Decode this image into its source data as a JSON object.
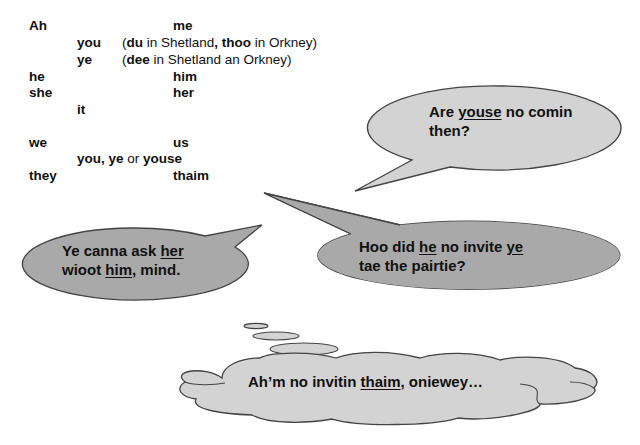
{
  "pronoun_table": {
    "rows": [
      {
        "subject": "Ah",
        "object": "me"
      },
      {
        "mid": "you",
        "note_open": "(",
        "note_b1": "du",
        "note_t1": " in Shetland",
        "note_comma": ", ",
        "note_b2": "thoo",
        "note_t2": " in Orkney)"
      },
      {
        "mid": "ye",
        "note_open": "(",
        "note_b1": "dee",
        "note_t1": " in Shetland an Orkney)"
      },
      {
        "subject": "he",
        "object": "him"
      },
      {
        "subject": "she",
        "object": "her"
      },
      {
        "mid": "it"
      },
      {
        "subject": "we",
        "object": "us"
      },
      {
        "mid_b1": "you, ye",
        "mid_or": " or ",
        "mid_b2": "youse"
      },
      {
        "subject": "they",
        "object": "thaim"
      }
    ]
  },
  "bubbles": {
    "youse": {
      "pre": "Are ",
      "u": "youse",
      "post": " no comin",
      "line2": "then?",
      "fill": "#d3d3d3"
    },
    "her": {
      "pre": "Ye canna ask ",
      "u": "her",
      "line2_pre": "wioot ",
      "line2_u": "him",
      "line2_post": ", mind.",
      "fill": "#a9a9a9"
    },
    "he": {
      "pre": "Hoo did ",
      "u": "he",
      "mid": " no invite ",
      "u2": "ye",
      "line2": "tae the pairtie?",
      "fill": "#a9a9a9"
    },
    "thaim": {
      "pre": "Ah’m no invitin ",
      "u": "thaim",
      "post": ", oniewey…",
      "fill": "#d3d3d3"
    }
  },
  "colors": {
    "outline": "#444444",
    "light_fill": "#d3d3d3",
    "dark_fill": "#a9a9a9"
  }
}
